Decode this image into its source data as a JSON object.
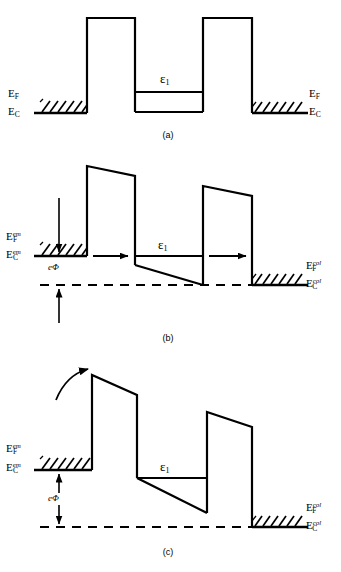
{
  "figure": {
    "stroke_color": "#000000",
    "background": "#ffffff"
  },
  "panels": [
    {
      "id": "a",
      "caption": "(a)",
      "condition": "zero bias",
      "labels": {
        "left_fermi": "E",
        "left_fermi_sub": "F",
        "left_cond": "E",
        "left_cond_sub": "C",
        "right_fermi": "E",
        "right_fermi_sub": "F",
        "right_cond": "E",
        "right_cond_sub": "C",
        "resonant_level": "ε",
        "resonant_level_sub": "1"
      }
    },
    {
      "id": "b",
      "caption": "(b)",
      "condition": "resonant bias, current peak",
      "labels": {
        "left_fermi": "E",
        "left_fermi_sub": "F",
        "left_fermi_sup": "em",
        "left_cond": "E",
        "left_cond_sub": "C",
        "left_cond_sup": "em",
        "right_fermi": "E",
        "right_fermi_sub": "F",
        "right_fermi_sup": "col",
        "right_cond": "E",
        "right_cond_sub": "C",
        "right_cond_sup": "col",
        "resonant_level": "ε",
        "resonant_level_sub": "1",
        "bias": "eΦ"
      }
    },
    {
      "id": "c",
      "caption": "(c)",
      "condition": "off-resonance bias, thermionic emission",
      "labels": {
        "left_fermi": "E",
        "left_fermi_sub": "F",
        "left_fermi_sup": "em",
        "left_cond": "E",
        "left_cond_sub": "C",
        "left_cond_sup": "em",
        "right_fermi": "E",
        "right_fermi_sub": "F",
        "right_fermi_sup": "col",
        "right_cond": "E",
        "right_cond_sub": "C",
        "right_cond_sup": "col",
        "resonant_level": "ε",
        "resonant_level_sub": "1",
        "bias": "eΦ"
      }
    }
  ]
}
